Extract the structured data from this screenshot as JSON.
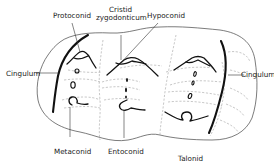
{
  "diagram": {
    "labels": {
      "protoconid": "Protoconid",
      "cristid_line1": "Cristid",
      "cristid_line2": "zygodonticum",
      "hypoconid": "Hypoconid",
      "cingulum_left": "Cingulum",
      "cingulum_right": "Cingulum",
      "metaconid": "Metaconid",
      "entoconid": "Entoconid",
      "talonid": "Talonid"
    },
    "colors": {
      "background": "#ffffff",
      "ink": "#111111",
      "dashed": "#9a9a9a"
    }
  }
}
